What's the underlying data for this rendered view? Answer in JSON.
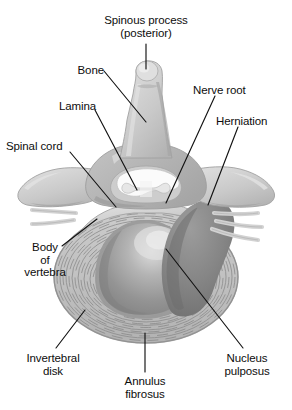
{
  "figure": {
    "background_color": "#ffffff",
    "text_color": "#0d0d0d",
    "leader_line_color": "#1a1a1a"
  },
  "palette": {
    "bone_light": "#d4d4d4",
    "bone_mid": "#bfbfbf",
    "bone_shadow": "#a8a8a8",
    "bone_highlight": "#e2e2e2",
    "annulus_fill": "#c2c2c2",
    "annulus_ring_line": "#8f8f8f",
    "annulus_outer_edge": "#9a9a9a",
    "nucleus_dark": "#8a8a8a",
    "nucleus_mid": "#9d9d9d",
    "nucleus_highlight": "#d8d8d8",
    "herniation_dark": "#7e7e7e",
    "spinal_cord_white": "#fcfcfc",
    "canal_gray": "#cfcfcf",
    "nerve_light": "#dcdcdc"
  },
  "labels": [
    {
      "id": "spinous-process",
      "name": "label-spinous-process",
      "line1": "Spinous process",
      "line2": "(posterior)",
      "align": "center",
      "x": 88,
      "y": 14,
      "width": 116
    },
    {
      "id": "bone",
      "name": "label-bone",
      "line1": "Bone",
      "line2": "",
      "align": "right",
      "x": 40,
      "y": 64,
      "width": 64
    },
    {
      "id": "lamina",
      "name": "label-lamina",
      "line1": "Lamina",
      "line2": "",
      "align": "right",
      "x": 20,
      "y": 100,
      "width": 76
    },
    {
      "id": "spinal-cord",
      "name": "label-spinal-cord",
      "line1": "Spinal cord",
      "line2": "",
      "align": "left",
      "x": 6,
      "y": 140,
      "width": 80
    },
    {
      "id": "nerve-root",
      "name": "label-nerve-root",
      "line1": "Nerve root",
      "line2": "",
      "align": "left",
      "x": 193,
      "y": 84,
      "width": 78
    },
    {
      "id": "herniation",
      "name": "label-herniation",
      "line1": "Herniation",
      "line2": "",
      "align": "left",
      "x": 216,
      "y": 115,
      "width": 76
    },
    {
      "id": "body-of-vertebra",
      "name": "label-body-of-vertebra",
      "line1": "Body",
      "line2": "of",
      "line3": "vertebra",
      "align": "center",
      "x": 8,
      "y": 241,
      "width": 74
    },
    {
      "id": "invertebral-disk",
      "name": "label-invertebral-disk",
      "line1": "Invertebral",
      "line2": "disk",
      "align": "center",
      "x": 16,
      "y": 352,
      "width": 74
    },
    {
      "id": "annulus-fibrosus",
      "name": "label-annulus-fibrosus",
      "line1": "Annulus",
      "line2": "fibrosus",
      "align": "center",
      "x": 109,
      "y": 375,
      "width": 72
    },
    {
      "id": "nucleus-pulposus",
      "name": "label-nucleus-pulposus",
      "line1": "Nucleus",
      "line2": "pulposus",
      "align": "center",
      "x": 209,
      "y": 352,
      "width": 76
    }
  ],
  "leader_lines": [
    {
      "id": "leader-spinous-process",
      "name": "leader-line-spinous-process",
      "x1": 146,
      "y1": 44,
      "x2": 146,
      "y2": 69
    },
    {
      "id": "leader-bone",
      "name": "leader-line-bone",
      "x1": 104,
      "y1": 71,
      "x2": 146,
      "y2": 122
    },
    {
      "id": "leader-lamina",
      "name": "leader-line-lamina",
      "x1": 95,
      "y1": 110,
      "x2": 137,
      "y2": 190
    },
    {
      "id": "leader-spinal-cord",
      "name": "leader-line-spinal-cord",
      "x1": 70,
      "y1": 152,
      "x2": 116,
      "y2": 207
    },
    {
      "id": "leader-nerve-root",
      "name": "leader-line-nerve-root",
      "x1": 215,
      "y1": 96,
      "x2": 166,
      "y2": 203
    },
    {
      "id": "leader-herniation",
      "name": "leader-line-herniation",
      "x1": 238,
      "y1": 127,
      "x2": 208,
      "y2": 205
    },
    {
      "id": "leader-body-of-vertebra",
      "name": "leader-line-body-of-vertebra",
      "x1": 62,
      "y1": 246,
      "x2": 97,
      "y2": 219
    },
    {
      "id": "leader-invertebral-disk",
      "name": "leader-line-invertebral-disk",
      "x1": 56,
      "y1": 348,
      "x2": 85,
      "y2": 310
    },
    {
      "id": "leader-annulus-fibrosus",
      "name": "leader-line-annulus-fibrosus",
      "x1": 145,
      "y1": 372,
      "x2": 145,
      "y2": 333
    },
    {
      "id": "leader-nucleus-pulposus",
      "name": "leader-line-nucleus-pulposus",
      "x1": 243,
      "y1": 348,
      "x2": 166,
      "y2": 249
    }
  ],
  "structures": [
    {
      "id": "spinous-process",
      "name": "spinous-process-shape",
      "description": "Posterior bony spine projecting upward at top center"
    },
    {
      "id": "lamina",
      "name": "lamina-shape",
      "description": "Bony plate forming posterior arch of the vertebral canal"
    },
    {
      "id": "transverse-left",
      "name": "transverse-process-left-shape",
      "description": "Left lateral bony wing"
    },
    {
      "id": "transverse-right",
      "name": "transverse-process-right-shape",
      "description": "Right lateral bony wing"
    },
    {
      "id": "spinal-cord",
      "name": "spinal-cord-shape",
      "description": "Butterfly shaped cord within the spinal canal"
    },
    {
      "id": "nerve-root",
      "name": "nerve-root-shape",
      "description": "Nerve root exiting laterally, compressed on the right"
    },
    {
      "id": "vertebral-body",
      "name": "vertebral-body-shape",
      "description": "Large anterior body of the vertebra"
    },
    {
      "id": "annulus-fibrosus",
      "name": "annulus-fibrosus-shape",
      "description": "Concentric lamellar rings of the outer disk"
    },
    {
      "id": "nucleus-pulposus",
      "name": "nucleus-pulposus-shape",
      "description": "Central gel core of the disk"
    },
    {
      "id": "herniation",
      "name": "herniation-shape",
      "description": "Dark protruding mass compressing the nerve root"
    }
  ]
}
